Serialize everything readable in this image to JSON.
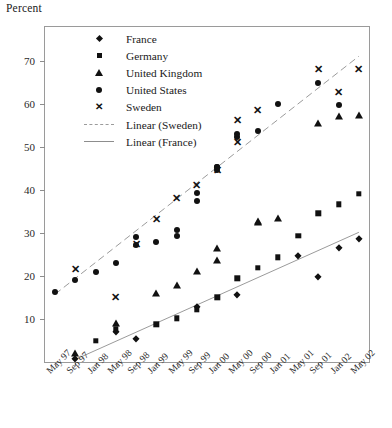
{
  "chart_data": {
    "type": "scatter",
    "title": "",
    "ylabel": "Percent",
    "xlabel": "",
    "ylim": [
      0,
      78
    ],
    "yticks": [
      10,
      20,
      30,
      40,
      50,
      60,
      70
    ],
    "grid": false,
    "legend_position": "inside-top-left",
    "categories": [
      "May 97",
      "Sep 97",
      "Jan 98",
      "May 98",
      "Sep 98",
      "Jan 99",
      "May 99",
      "Sep 99",
      "Jan 00",
      "May 00",
      "Sep 00",
      "Jan 01",
      "May 01",
      "Sep 01",
      "Jan 02",
      "May 02"
    ],
    "x_tick_count": 16,
    "legend": [
      {
        "label": "France",
        "marker": "diamond"
      },
      {
        "label": "Germany",
        "marker": "square"
      },
      {
        "label": "United Kingdom",
        "marker": "triangle"
      },
      {
        "label": "United States",
        "marker": "circle"
      },
      {
        "label": "Sweden",
        "marker": "x"
      },
      {
        "label": "Linear (Sweden)",
        "marker": "dashed-line"
      },
      {
        "label": "Linear (France)",
        "marker": "solid-line"
      }
    ],
    "series": [
      {
        "name": "France",
        "marker": "diamond",
        "points": [
          {
            "x": "Sep 97",
            "y": 0.8
          },
          {
            "x": "May 98",
            "y": 6.9
          },
          {
            "x": "Sep 98",
            "y": 5.4
          },
          {
            "x": "Sep 99",
            "y": 12.9
          },
          {
            "x": "May 00",
            "y": 15.5
          },
          {
            "x": "May 01",
            "y": 24.6
          },
          {
            "x": "Sep 01",
            "y": 19.9
          },
          {
            "x": "Jan 02",
            "y": 26.5
          },
          {
            "x": "May 02",
            "y": 28.7
          }
        ]
      },
      {
        "name": "Germany",
        "marker": "square",
        "points": [
          {
            "x": "Jan 98",
            "y": 4.9
          },
          {
            "x": "May 98",
            "y": 7.6
          },
          {
            "x": "Jan 99",
            "y": 8.8
          },
          {
            "x": "May 99",
            "y": 10.2
          },
          {
            "x": "Sep 99",
            "y": 12.2
          },
          {
            "x": "Jan 00",
            "y": 15.1
          },
          {
            "x": "May 00",
            "y": 19.5
          },
          {
            "x": "Sep 00",
            "y": 21.9
          },
          {
            "x": "Jan 01",
            "y": 24.4
          },
          {
            "x": "May 01",
            "y": 29.4
          },
          {
            "x": "Sep 01",
            "y": 34.6
          },
          {
            "x": "Jan 02",
            "y": 36.7
          },
          {
            "x": "May 02",
            "y": 39.1
          }
        ]
      },
      {
        "name": "United Kingdom",
        "marker": "triangle",
        "points": [
          {
            "x": "Sep 97",
            "y": 2.2
          },
          {
            "x": "May 98",
            "y": 9.0
          },
          {
            "x": "Jan 99",
            "y": 16.1
          },
          {
            "x": "May 99",
            "y": 18.0
          },
          {
            "x": "Sep 99",
            "y": 21.2
          },
          {
            "x": "Jan 00",
            "y": 23.7
          },
          {
            "x": "Jan 00",
            "y": 26.6
          },
          {
            "x": "Sep 00",
            "y": 32.6
          },
          {
            "x": "Sep 00",
            "y": 32.8
          },
          {
            "x": "Jan 01",
            "y": 33.6
          },
          {
            "x": "Sep 01",
            "y": 55.6
          },
          {
            "x": "Jan 02",
            "y": 57.2
          },
          {
            "x": "May 02",
            "y": 57.5
          }
        ]
      },
      {
        "name": "United States",
        "marker": "circle",
        "points": [
          {
            "x": "May 97",
            "y": 16.2
          },
          {
            "x": "Sep 97",
            "y": 19.2
          },
          {
            "x": "Jan 98",
            "y": 21.0
          },
          {
            "x": "May 98",
            "y": 23.0
          },
          {
            "x": "Sep 98",
            "y": 27.2
          },
          {
            "x": "Sep 98",
            "y": 29.0
          },
          {
            "x": "Jan 99",
            "y": 27.9
          },
          {
            "x": "May 99",
            "y": 29.4
          },
          {
            "x": "May 99",
            "y": 30.7
          },
          {
            "x": "Sep 99",
            "y": 37.5
          },
          {
            "x": "Sep 99",
            "y": 39.4
          },
          {
            "x": "Jan 00",
            "y": 44.6
          },
          {
            "x": "Jan 00",
            "y": 45.3
          },
          {
            "x": "Jan 00",
            "y": 45.5
          },
          {
            "x": "May 00",
            "y": 52.4
          },
          {
            "x": "May 00",
            "y": 53.2
          },
          {
            "x": "Sep 00",
            "y": 53.8
          },
          {
            "x": "Jan 01",
            "y": 60.1
          },
          {
            "x": "Sep 01",
            "y": 64.9
          },
          {
            "x": "Jan 02",
            "y": 59.8
          }
        ]
      },
      {
        "name": "Sweden",
        "marker": "x",
        "points": [
          {
            "x": "Sep 97",
            "y": 21.4
          },
          {
            "x": "May 98",
            "y": 15.0
          },
          {
            "x": "Sep 98",
            "y": 27.3
          },
          {
            "x": "Jan 99",
            "y": 33.0
          },
          {
            "x": "May 99",
            "y": 37.9
          },
          {
            "x": "Sep 99",
            "y": 41.0
          },
          {
            "x": "Jan 00",
            "y": 44.4
          },
          {
            "x": "May 00",
            "y": 51.0
          },
          {
            "x": "May 00",
            "y": 56.2
          },
          {
            "x": "Sep 00",
            "y": 58.4
          },
          {
            "x": "Sep 01",
            "y": 68.0
          },
          {
            "x": "Jan 02",
            "y": 62.6
          },
          {
            "x": "May 02",
            "y": 68.0
          }
        ]
      }
    ],
    "trendlines": [
      {
        "name": "Linear (Sweden)",
        "style": "dashed",
        "x0": "May 97",
        "y0": 15.8,
        "x1": "May 02",
        "y1": 71.2
      },
      {
        "name": "Linear (France)",
        "style": "solid",
        "x0": "Sep 97",
        "y0": 0.6,
        "x1": "May 02",
        "y1": 30.2
      }
    ]
  }
}
